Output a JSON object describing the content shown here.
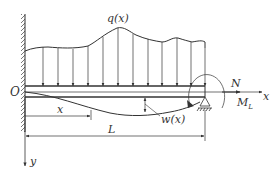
{
  "diagram": {
    "type": "cantilever-beam-distributed-load",
    "labels": {
      "load": "q(x)",
      "origin": "O",
      "axial_force": "N",
      "x_axis": "x",
      "moment": "M",
      "moment_sub": "L",
      "position": "x",
      "length": "L",
      "deflection": "w(x)",
      "y_axis": "y"
    },
    "colors": {
      "stroke": "#333333",
      "background": "#ffffff"
    }
  }
}
